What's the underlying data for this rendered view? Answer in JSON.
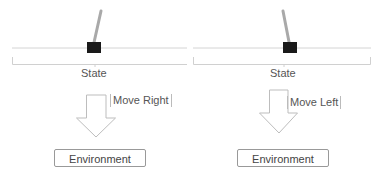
{
  "colors": {
    "track": "#cfcfcf",
    "cart": "#1a1a1a",
    "pole": "#a9a9a9",
    "arrow_stroke": "#bdbdbd",
    "text": "#555555",
    "box_border": "#999999"
  },
  "panels": [
    {
      "id": "left",
      "state_label": "State",
      "action_label": "Move Right",
      "environment_label": "Environment",
      "pole_lean": "right"
    },
    {
      "id": "right",
      "state_label": "State",
      "action_label": "Move Left",
      "environment_label": "Environment",
      "pole_lean": "left"
    }
  ]
}
